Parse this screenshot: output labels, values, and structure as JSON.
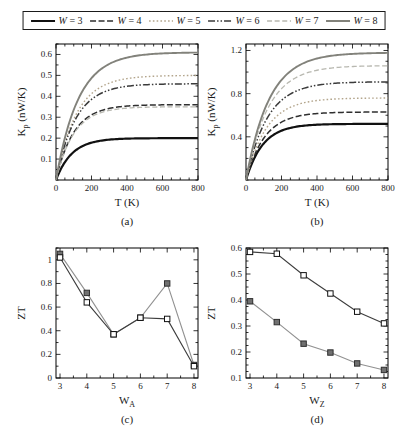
{
  "figure": {
    "background": "#ffffff",
    "frame_color": "#000000"
  },
  "legend": {
    "separator": " = ",
    "entries": [
      {
        "var": "W",
        "value": "3",
        "color": "#111111",
        "dash": "",
        "width": 2.2
      },
      {
        "var": "W",
        "value": "4",
        "color": "#2f2f2f",
        "dash": "6,2.5",
        "width": 1.5
      },
      {
        "var": "W",
        "value": "5",
        "color": "#b3a58c",
        "dash": "1.6,2.2",
        "width": 1.4
      },
      {
        "var": "W",
        "value": "6",
        "color": "#3a3a3a",
        "dash": "7,2,1.5,2,1.5,2",
        "width": 1.5
      },
      {
        "var": "W",
        "value": "7",
        "color": "#b8b8b0",
        "dash": "5,2.6",
        "width": 1.3
      },
      {
        "var": "W",
        "value": "8",
        "color": "#82827b",
        "dash": "",
        "width": 1.9
      }
    ]
  },
  "chart_data": [
    {
      "id": "a",
      "type": "line",
      "caption": "(a)",
      "xlabel": {
        "main": "T (K)"
      },
      "ylabel": {
        "main": "K",
        "sub": "p",
        "rest": " (nW/K)"
      },
      "xlim": [
        0,
        800
      ],
      "ylim": [
        0,
        0.65
      ],
      "xticks": {
        "major": [
          0,
          200,
          400,
          600,
          800
        ],
        "labels": [
          "0",
          "200",
          "400",
          "600",
          "800"
        ],
        "minor_step": 50
      },
      "yticks": {
        "major": [
          0.1,
          0.2,
          0.3,
          0.4,
          0.5,
          0.6
        ],
        "labels": [
          "0.1",
          "0.2",
          "0.3",
          "0.4",
          "0.5",
          "0.6"
        ],
        "minor_step": 0.05
      },
      "grid": false,
      "model": "y = saturation * (1 - exp(-T / rise_K))",
      "series": [
        {
          "name": "W = 3",
          "legend_style": 0,
          "saturation": 0.2,
          "rise_K": 90
        },
        {
          "name": "W = 4",
          "legend_style": 1,
          "saturation": 0.36,
          "rise_K": 100
        },
        {
          "name": "W = 5",
          "legend_style": 2,
          "saturation": 0.5,
          "rise_K": 115
        },
        {
          "name": "W = 6",
          "legend_style": 3,
          "saturation": 0.46,
          "rise_K": 110
        },
        {
          "name": "W = 7",
          "legend_style": 4,
          "saturation": 0.35,
          "rise_K": 100
        },
        {
          "name": "W = 8",
          "legend_style": 5,
          "saturation": 0.61,
          "rise_K": 125
        }
      ]
    },
    {
      "id": "b",
      "type": "line",
      "caption": "(b)",
      "xlabel": {
        "main": "T (K)"
      },
      "ylabel": {
        "main": "K",
        "sub": "p",
        "rest": " (nW/K)"
      },
      "xlim": [
        0,
        800
      ],
      "ylim": [
        0,
        1.26
      ],
      "xticks": {
        "major": [
          0,
          200,
          400,
          600,
          800
        ],
        "labels": [
          "0",
          "200",
          "400",
          "600",
          "800"
        ],
        "minor_step": 50
      },
      "yticks": {
        "major": [
          0.4,
          0.8,
          1.2
        ],
        "labels": [
          "0.4",
          "0.8",
          "1.2"
        ],
        "minor_step": 0.1
      },
      "grid": false,
      "model": "y = saturation * (1 - exp(-T / rise_K))",
      "series": [
        {
          "name": "W = 3",
          "legend_style": 0,
          "saturation": 0.52,
          "rise_K": 95
        },
        {
          "name": "W = 4",
          "legend_style": 1,
          "saturation": 0.63,
          "rise_K": 105
        },
        {
          "name": "W = 5",
          "legend_style": 2,
          "saturation": 0.76,
          "rise_K": 115
        },
        {
          "name": "W = 6",
          "legend_style": 3,
          "saturation": 0.91,
          "rise_K": 120
        },
        {
          "name": "W = 7",
          "legend_style": 4,
          "saturation": 1.06,
          "rise_K": 125
        },
        {
          "name": "W = 8",
          "legend_style": 5,
          "saturation": 1.18,
          "rise_K": 130
        }
      ]
    },
    {
      "id": "c",
      "type": "scatter-line",
      "caption": "(c)",
      "xlabel": {
        "main": "W",
        "sub": "A"
      },
      "ylabel": {
        "main": "ZT"
      },
      "xlim": [
        2.85,
        8.15
      ],
      "ylim": [
        0,
        1.1
      ],
      "xticks": {
        "major": [
          3,
          4,
          5,
          6,
          7,
          8
        ],
        "labels": [
          "3",
          "4",
          "5",
          "6",
          "7",
          "8"
        ],
        "minor_step": 0.5
      },
      "yticks": {
        "major": [
          0,
          0.2,
          0.4,
          0.6,
          0.8,
          1.0
        ],
        "labels": [
          "0",
          "0.2",
          "0.4",
          "0.6",
          "0.8",
          "1"
        ],
        "minor_step": 0.1
      },
      "grid": false,
      "x": [
        3,
        4,
        5,
        6,
        7,
        8
      ],
      "series": [
        {
          "name": "filled-squares",
          "marker": "filled-square",
          "line_color": "#919191",
          "marker_fill": "#707070",
          "marker_stroke": "#2f2f2f",
          "values": [
            1.05,
            0.72,
            0.37,
            0.51,
            0.8,
            0.11
          ]
        },
        {
          "name": "open-squares",
          "marker": "open-square",
          "line_color": "#3d3d3d",
          "marker_fill": "#ffffff",
          "marker_stroke": "#111111",
          "values": [
            1.02,
            0.64,
            0.37,
            0.51,
            0.5,
            0.1
          ]
        }
      ]
    },
    {
      "id": "d",
      "type": "scatter-line",
      "caption": "(d)",
      "xlabel": {
        "main": "W",
        "sub": "Z"
      },
      "ylabel": {
        "main": "ZT"
      },
      "xlim": [
        2.85,
        8.15
      ],
      "ylim": [
        0.1,
        0.6
      ],
      "xticks": {
        "major": [
          3,
          4,
          5,
          6,
          7,
          8
        ],
        "labels": [
          "3",
          "4",
          "5",
          "6",
          "7",
          "8"
        ],
        "minor_step": 0.5
      },
      "yticks": {
        "major": [
          0.1,
          0.2,
          0.3,
          0.4,
          0.5,
          0.6
        ],
        "labels": [
          "0.1",
          "0.2",
          "0.3",
          "0.4",
          "0.5",
          "0.6"
        ],
        "minor_step": 0.025
      },
      "grid": false,
      "x": [
        3,
        4,
        5,
        6,
        7,
        8
      ],
      "series": [
        {
          "name": "open-squares",
          "marker": "open-square",
          "line_color": "#3d3d3d",
          "marker_fill": "#ffffff",
          "marker_stroke": "#111111",
          "values": [
            0.585,
            0.578,
            0.495,
            0.425,
            0.355,
            0.31
          ]
        },
        {
          "name": "filled-squares",
          "marker": "filled-square",
          "line_color": "#919191",
          "marker_fill": "#707070",
          "marker_stroke": "#2f2f2f",
          "values": [
            0.395,
            0.315,
            0.232,
            0.198,
            0.156,
            0.131
          ]
        }
      ]
    }
  ]
}
